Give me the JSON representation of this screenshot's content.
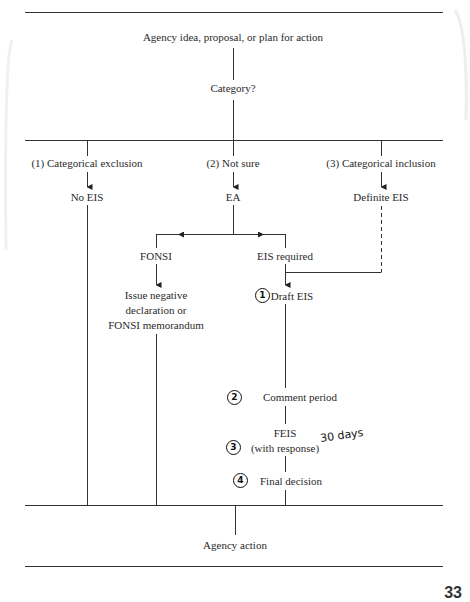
{
  "diagram": {
    "nodes": {
      "start": "Agency idea, proposal, or plan for action",
      "category": "Category?",
      "branch1": "(1) Categorical exclusion",
      "branch2": "(2) Not sure",
      "branch3": "(3) Categorical inclusion",
      "no_eis": "No EIS",
      "ea": "EA",
      "definite_eis": "Definite EIS",
      "fonsi": "FONSI",
      "eis_required": "EIS required",
      "issue_line1": "Issue negative",
      "issue_line2": "declaration or",
      "issue_line3": "FONSI memorandum",
      "draft_eis": "Draft EIS",
      "comment_period": "Comment period",
      "feis": "FEIS",
      "feis_sub": "(with response)",
      "final_decision": "Final decision",
      "agency_action": "Agency action"
    },
    "annotations": {
      "step1": "1",
      "step2": "2",
      "step3": "3",
      "step4": "4",
      "note_days": "30 days"
    },
    "page_number": "33"
  }
}
